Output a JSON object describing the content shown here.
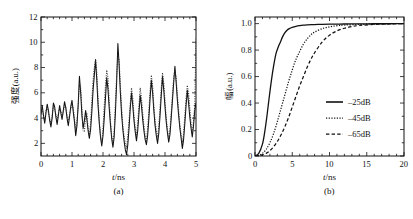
{
  "figure": {
    "panels": [
      {
        "caption": "(a)",
        "xlabel": "t/ns",
        "ylabel": "强度(a.u.)",
        "xticks": [
          "0",
          "1",
          "2",
          "3",
          "4",
          "5"
        ],
        "yticks": [
          "2",
          "4",
          "6",
          "8",
          "10",
          "12"
        ]
      },
      {
        "caption": "(b)",
        "xlabel": "t/ns",
        "ylabel": "幅(a.u.)",
        "xticks": [
          "0",
          "5",
          "10",
          "15",
          "20"
        ],
        "yticks": [
          "0",
          "0.2",
          "0.4",
          "0.6",
          "0.8",
          "1.0"
        ],
        "legend": [
          {
            "label": "–25dB",
            "style": "solid"
          },
          {
            "label": "–45dB",
            "style": "dotted"
          },
          {
            "label": "–65dB",
            "style": "dashed"
          }
        ]
      }
    ]
  },
  "chart_data": [
    {
      "type": "line",
      "title": "(a)",
      "xlabel": "t/ns",
      "ylabel": "强度(a.u.)",
      "xlim": [
        0,
        5
      ],
      "ylim": [
        1,
        12
      ],
      "grid": false,
      "legend": null,
      "xticks": [
        0,
        1,
        2,
        3,
        4,
        5
      ],
      "yticks": [
        2,
        4,
        6,
        8,
        10,
        12
      ],
      "series": [
        {
          "name": "trace-solid",
          "style": "solid",
          "x": [
            0.0,
            0.04,
            0.08,
            0.12,
            0.16,
            0.2,
            0.24,
            0.28,
            0.32,
            0.36,
            0.4,
            0.44,
            0.48,
            0.52,
            0.56,
            0.6,
            0.64,
            0.68,
            0.72,
            0.76,
            0.8,
            0.84,
            0.88,
            0.92,
            0.96,
            1.0,
            1.04,
            1.08,
            1.12,
            1.16,
            1.2,
            1.24,
            1.28,
            1.32,
            1.36,
            1.4,
            1.44,
            1.48,
            1.52,
            1.56,
            1.6,
            1.64,
            1.68,
            1.72,
            1.76,
            1.8,
            1.84,
            1.88,
            1.92,
            1.96,
            2.0,
            2.04,
            2.08,
            2.12,
            2.16,
            2.2,
            2.24,
            2.28,
            2.32,
            2.36,
            2.4,
            2.44,
            2.48,
            2.52,
            2.56,
            2.6,
            2.64,
            2.68,
            2.72,
            2.76,
            2.8,
            2.84,
            2.88,
            2.92,
            2.96,
            3.0,
            3.04,
            3.08,
            3.12,
            3.16,
            3.2,
            3.24,
            3.28,
            3.32,
            3.36,
            3.4,
            3.44,
            3.48,
            3.52,
            3.56,
            3.6,
            3.64,
            3.68,
            3.72,
            3.76,
            3.8,
            3.84,
            3.88,
            3.92,
            3.96,
            4.0,
            4.04,
            4.08,
            4.12,
            4.16,
            4.2,
            4.24,
            4.28,
            4.32,
            4.36,
            4.4,
            4.44,
            4.48,
            4.52,
            4.56,
            4.6,
            4.64,
            4.68,
            4.72,
            4.76,
            4.8,
            4.84,
            4.88,
            4.92,
            4.96,
            5.0
          ],
          "y": [
            4.3,
            5.0,
            4.2,
            3.6,
            4.4,
            5.1,
            4.6,
            3.8,
            3.3,
            4.0,
            5.2,
            4.9,
            4.1,
            3.5,
            4.2,
            5.0,
            4.4,
            3.9,
            4.6,
            5.3,
            4.8,
            4.0,
            3.4,
            4.1,
            4.9,
            5.4,
            4.5,
            3.7,
            2.6,
            3.4,
            5.1,
            7.3,
            6.0,
            4.2,
            3.2,
            3.8,
            4.6,
            3.9,
            3.0,
            2.4,
            3.1,
            4.5,
            6.2,
            7.4,
            8.6,
            7.0,
            5.0,
            3.6,
            2.5,
            1.8,
            2.6,
            4.0,
            5.6,
            7.2,
            6.3,
            4.8,
            3.5,
            2.4,
            1.7,
            2.5,
            4.4,
            6.8,
            9.9,
            8.2,
            6.0,
            4.3,
            3.1,
            2.2,
            1.5,
            1.1,
            1.9,
            3.2,
            4.8,
            6.0,
            5.0,
            3.8,
            2.9,
            2.2,
            3.0,
            4.4,
            5.8,
            5.0,
            3.9,
            3.0,
            2.3,
            1.9,
            2.6,
            4.0,
            5.6,
            7.0,
            6.0,
            4.6,
            3.4,
            2.6,
            2.0,
            2.8,
            4.2,
            5.8,
            7.3,
            6.2,
            4.9,
            3.7,
            2.8,
            2.1,
            2.7,
            4.0,
            5.4,
            6.8,
            8.1,
            6.8,
            5.4,
            4.2,
            3.2,
            2.4,
            1.6,
            2.3,
            3.6,
            5.0,
            6.2,
            5.2,
            4.1,
            3.2,
            2.5,
            3.4,
            4.6,
            5.2
          ]
        },
        {
          "name": "trace-dotted",
          "style": "dotted",
          "x": [
            0.0,
            0.04,
            0.08,
            0.12,
            0.16,
            0.2,
            0.24,
            0.28,
            0.32,
            0.36,
            0.4,
            0.44,
            0.48,
            0.52,
            0.56,
            0.6,
            0.64,
            0.68,
            0.72,
            0.76,
            0.8,
            0.84,
            0.88,
            0.92,
            0.96,
            1.0,
            1.04,
            1.08,
            1.12,
            1.16,
            1.2,
            1.24,
            1.28,
            1.32,
            1.36,
            1.4,
            1.44,
            1.48,
            1.52,
            1.56,
            1.6,
            1.64,
            1.68,
            1.72,
            1.76,
            1.8,
            1.84,
            1.88,
            1.92,
            1.96,
            2.0,
            2.04,
            2.08,
            2.12,
            2.16,
            2.2,
            2.24,
            2.28,
            2.32,
            2.36,
            2.4,
            2.44,
            2.48,
            2.52,
            2.56,
            2.6,
            2.64,
            2.68,
            2.72,
            2.76,
            2.8,
            2.84,
            2.88,
            2.92,
            2.96,
            3.0,
            3.04,
            3.08,
            3.12,
            3.16,
            3.2,
            3.24,
            3.28,
            3.32,
            3.36,
            3.4,
            3.44,
            3.48,
            3.52,
            3.56,
            3.6,
            3.64,
            3.68,
            3.72,
            3.76,
            3.8,
            3.84,
            3.88,
            3.92,
            3.96,
            4.0,
            4.04,
            4.08,
            4.12,
            4.16,
            4.2,
            4.24,
            4.28,
            4.32,
            4.36,
            4.4,
            4.44,
            4.48,
            4.52,
            4.56,
            4.6,
            4.64,
            4.68,
            4.72,
            4.76,
            4.8,
            4.84,
            4.88,
            4.92,
            4.96,
            5.0
          ],
          "y": [
            4.5,
            4.8,
            4.1,
            3.8,
            4.6,
            4.9,
            4.4,
            4.0,
            3.6,
            4.2,
            5.0,
            4.7,
            4.3,
            3.8,
            4.4,
            4.8,
            4.6,
            4.1,
            4.5,
            5.0,
            4.9,
            4.2,
            3.8,
            4.3,
            4.7,
            5.2,
            4.8,
            4.0,
            3.0,
            3.8,
            4.9,
            6.8,
            6.4,
            4.8,
            3.0,
            2.9,
            4.2,
            4.4,
            3.2,
            2.6,
            3.6,
            5.4,
            7.0,
            8.0,
            8.7,
            7.6,
            5.6,
            3.8,
            2.6,
            2.0,
            3.2,
            5.0,
            6.6,
            7.8,
            7.2,
            5.4,
            3.8,
            2.6,
            2.0,
            3.0,
            5.2,
            7.4,
            9.0,
            8.6,
            6.6,
            4.8,
            3.4,
            2.6,
            2.0,
            1.6,
            2.6,
            3.8,
            5.2,
            6.4,
            5.6,
            4.2,
            3.2,
            2.6,
            3.6,
            5.0,
            6.4,
            5.6,
            4.4,
            3.4,
            2.6,
            2.2,
            3.2,
            4.6,
            6.2,
            7.4,
            6.6,
            5.0,
            3.8,
            3.0,
            2.4,
            3.4,
            4.8,
            6.4,
            7.6,
            6.8,
            5.4,
            4.0,
            3.1,
            2.4,
            3.1,
            4.4,
            5.8,
            7.2,
            7.8,
            7.2,
            5.8,
            4.6,
            3.5,
            2.7,
            2.0,
            2.8,
            4.2,
            5.6,
            6.6,
            6.0,
            4.8,
            3.6,
            2.8,
            3.8,
            5.0,
            10.3
          ]
        }
      ]
    },
    {
      "type": "line",
      "title": "(b)",
      "xlabel": "t/ns",
      "ylabel": "幅(a.u.)",
      "xlim": [
        0,
        20
      ],
      "ylim": [
        0,
        1.05
      ],
      "grid": false,
      "legend_position": "lower right",
      "xticks": [
        0,
        5,
        10,
        15,
        20
      ],
      "yticks": [
        0,
        0.2,
        0.4,
        0.6,
        0.8,
        1.0
      ],
      "series": [
        {
          "name": "-25dB",
          "style": "solid",
          "x": [
            0.0,
            0.5,
            1.0,
            1.3,
            1.6,
            1.9,
            2.2,
            2.5,
            2.8,
            3.1,
            3.4,
            3.7,
            4.0,
            4.3,
            4.6,
            5.0,
            5.5,
            6.0,
            6.5,
            7.0,
            8.0,
            9.0,
            10.0,
            12.0,
            14.0,
            16.0,
            18.0,
            20.0
          ],
          "y": [
            0.0,
            0.02,
            0.09,
            0.18,
            0.3,
            0.44,
            0.57,
            0.68,
            0.77,
            0.82,
            0.86,
            0.9,
            0.93,
            0.95,
            0.962,
            0.972,
            0.98,
            0.985,
            0.988,
            0.99,
            0.993,
            0.995,
            0.996,
            0.997,
            0.998,
            0.999,
            0.999,
            1.0
          ]
        },
        {
          "name": "-45dB",
          "style": "dotted",
          "x": [
            0.0,
            0.5,
            1.0,
            1.5,
            2.0,
            2.5,
            3.0,
            3.5,
            4.0,
            4.5,
            5.0,
            5.5,
            6.0,
            6.5,
            7.0,
            7.5,
            8.0,
            9.0,
            10.0,
            11.0,
            12.0,
            14.0,
            16.0,
            18.0,
            20.0
          ],
          "y": [
            0.0,
            0.005,
            0.02,
            0.05,
            0.1,
            0.17,
            0.26,
            0.36,
            0.46,
            0.56,
            0.65,
            0.73,
            0.79,
            0.845,
            0.885,
            0.915,
            0.936,
            0.962,
            0.976,
            0.984,
            0.989,
            0.994,
            0.997,
            0.999,
            1.0
          ]
        },
        {
          "name": "-65dB",
          "style": "dashed",
          "x": [
            0.0,
            0.5,
            1.0,
            1.5,
            2.0,
            2.5,
            3.0,
            3.5,
            4.0,
            4.5,
            5.0,
            5.5,
            6.0,
            6.5,
            7.0,
            7.5,
            8.0,
            9.0,
            10.0,
            11.0,
            12.0,
            13.0,
            14.0,
            16.0,
            18.0,
            20.0
          ],
          "y": [
            0.0,
            0.002,
            0.008,
            0.02,
            0.04,
            0.07,
            0.11,
            0.16,
            0.22,
            0.29,
            0.37,
            0.45,
            0.53,
            0.6,
            0.67,
            0.73,
            0.78,
            0.86,
            0.913,
            0.945,
            0.965,
            0.978,
            0.986,
            0.994,
            0.998,
            1.0
          ]
        }
      ]
    }
  ]
}
